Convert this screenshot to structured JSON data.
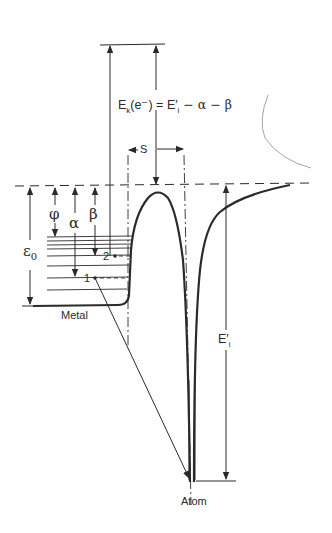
{
  "diagram": {
    "type": "energy-level diagram",
    "equation": {
      "lhs": "E",
      "lhs_sub": "k",
      "lhs_arg": "(e⁻)",
      "rhs": "= E′",
      "rhs_sub": "i",
      "rhs_tail": " − α − β"
    },
    "labels": {
      "spacing": "S",
      "work_function": "φ",
      "alpha": "α",
      "beta": "β",
      "epsilon": "ε",
      "epsilon_sub": "0",
      "level_1": "1",
      "level_2": "2",
      "metal": "Metal",
      "atom": "Atom",
      "ionization": "E′",
      "ionization_sub": "i"
    },
    "colors": {
      "ink": "#2a2a2a",
      "background": "#ffffff",
      "faint": "#9a9a9a"
    }
  }
}
